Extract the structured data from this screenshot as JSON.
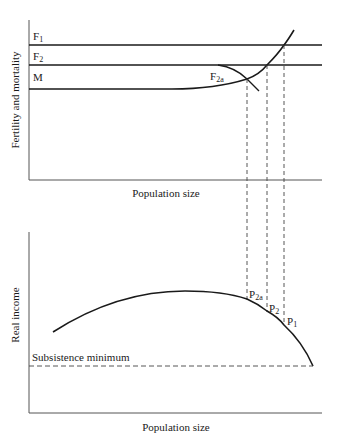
{
  "top_panel": {
    "ylabel": "Fertility and mortality",
    "xlabel": "Population size",
    "curves": {
      "F1": {
        "label": "F",
        "sub": "1"
      },
      "F2": {
        "label": "F",
        "sub": "2"
      },
      "M": {
        "label": "M"
      },
      "F2a": {
        "label": "F",
        "sub": "2a"
      }
    }
  },
  "bottom_panel": {
    "ylabel": "Real income",
    "xlabel": "Population size",
    "subsistence_label": "Subsistence minimum",
    "points": {
      "P2a": {
        "label": "P",
        "sub": "2a"
      },
      "P2": {
        "label": "P",
        "sub": "2"
      },
      "P1": {
        "label": "P",
        "sub": "1"
      }
    }
  },
  "colors": {
    "line": "#1a1a1a",
    "axis": "#555555",
    "dash": "#444444"
  }
}
